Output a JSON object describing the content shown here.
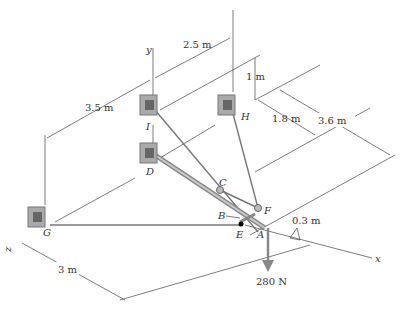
{
  "figure": {
    "axes": {
      "y": "y",
      "x": "x",
      "z": "z"
    },
    "points": {
      "I": "I",
      "H": "H",
      "D": "D",
      "G": "G",
      "C": "C",
      "F": "F",
      "B": "B",
      "E": "E",
      "A": "A"
    },
    "dimensions": {
      "d_2_5": "2.5 m",
      "d_3_5": "3.5 m",
      "d_1": "1 m",
      "d_1_8": "1.8 m",
      "d_3_6": "3.6 m",
      "d_0_3": "0.3 m",
      "d_3": "3 m"
    },
    "load": "280 N",
    "colors": {
      "line": "#444444",
      "cable": "#777777",
      "support": "#999999",
      "load_arrow": "#888888"
    }
  }
}
